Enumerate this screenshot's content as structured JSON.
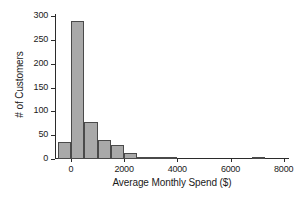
{
  "chart_data": {
    "type": "bar",
    "title": "",
    "subtitle": "",
    "xlabel": "Average Monthly Spend ($)",
    "ylabel": "# of Customers",
    "xlim": [
      -600,
      8200
    ],
    "ylim": [
      0,
      305
    ],
    "xticks": [
      0,
      2000,
      4000,
      6000,
      8000
    ],
    "xticklabels": [
      "0",
      "2000",
      "4000",
      "6000",
      "8000"
    ],
    "yticks": [
      0,
      50,
      100,
      150,
      200,
      250,
      300
    ],
    "yticklabels": [
      "0",
      "50",
      "100",
      "150",
      "200",
      "250",
      "300"
    ],
    "grid": false,
    "legend": null,
    "bin_width": 500,
    "bar_fill_color": "#a9a9a9",
    "bar_edge_color": "#4a4a4a",
    "axis_color": "#2b2b2b",
    "background_color": "#ffffff",
    "bins": [
      {
        "left": -500,
        "right": 0,
        "count": 36
      },
      {
        "left": 0,
        "right": 500,
        "count": 290
      },
      {
        "left": 500,
        "right": 1000,
        "count": 78
      },
      {
        "left": 1000,
        "right": 1500,
        "count": 41
      },
      {
        "left": 1500,
        "right": 2000,
        "count": 29
      },
      {
        "left": 2000,
        "right": 2500,
        "count": 13
      },
      {
        "left": 2500,
        "right": 3000,
        "count": 4
      },
      {
        "left": 3000,
        "right": 3500,
        "count": 5
      },
      {
        "left": 3500,
        "right": 4000,
        "count": 3
      },
      {
        "left": 6800,
        "right": 7300,
        "count": 4
      }
    ],
    "categories": [
      "-500",
      "0",
      "500",
      "1000",
      "1500",
      "2000",
      "2500",
      "3000",
      "3500",
      "6800"
    ],
    "values": [
      36,
      290,
      78,
      41,
      29,
      13,
      4,
      5,
      3,
      4
    ]
  }
}
